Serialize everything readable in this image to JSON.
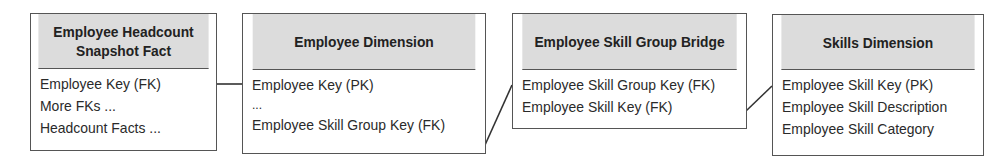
{
  "diagram": {
    "entities": [
      {
        "title": "Employee Headcount Snapshot Fact",
        "title_lines": [
          "Employee Headcount",
          "Snapshot Fact"
        ],
        "rows": [
          "Employee Key (FK)",
          "More FKs ...",
          "Headcount Facts ..."
        ]
      },
      {
        "title": "Employee Dimension",
        "rows": [
          "Employee Key (PK)",
          "...",
          "Employee Skill Group Key (FK)"
        ]
      },
      {
        "title": "Employee Skill Group Bridge",
        "rows": [
          "Employee Skill Group Key (FK)",
          "Employee Skill Key (FK)"
        ]
      },
      {
        "title": "Skills Dimension",
        "rows": [
          "Employee Skill Key (PK)",
          "Employee Skill Description",
          "Employee Skill Category"
        ]
      }
    ],
    "relationships": [
      {
        "from": "Employee Headcount Snapshot Fact.Employee Key (FK)",
        "to": "Employee Dimension.Employee Key (PK)"
      },
      {
        "from": "Employee Dimension.Employee Skill Group Key (FK)",
        "to": "Employee Skill Group Bridge.Employee Skill Group Key (FK)"
      },
      {
        "from": "Employee Skill Group Bridge.Employee Skill Key (FK)",
        "to": "Skills Dimension.Employee Skill Key (PK)"
      }
    ],
    "colors": {
      "header_fill": "#dcdcdc",
      "border": "#555555",
      "text": "#222222",
      "background": "#ffffff"
    }
  }
}
